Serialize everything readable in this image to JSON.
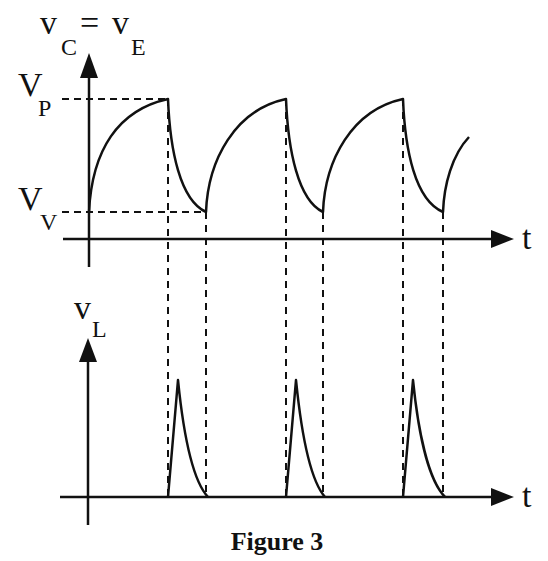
{
  "figure": {
    "caption": "Figure 3",
    "top_plot": {
      "y_label_main_left": "v",
      "y_label_sub_left": "C",
      "y_label_equals": "=",
      "y_label_main_right": "v",
      "y_label_sub_right": "E",
      "x_label": "t",
      "level_peak": {
        "main": "V",
        "sub": "P"
      },
      "level_valley": {
        "main": "V",
        "sub": "V"
      },
      "description": "Capacitor/emitter voltage charges exponentially toward V_P, then discharges rapidly to V_V, repeating (relaxation oscillation sawtooth)"
    },
    "bottom_plot": {
      "y_label_main": "v",
      "y_label_sub": "L",
      "x_label": "t",
      "description": "Output voltage pulses: a sharp spike at each discharge interval, aligned with the V_P to V_V transitions via dashed guide lines"
    },
    "colors": {
      "line": "#111111",
      "background": "#ffffff"
    }
  }
}
